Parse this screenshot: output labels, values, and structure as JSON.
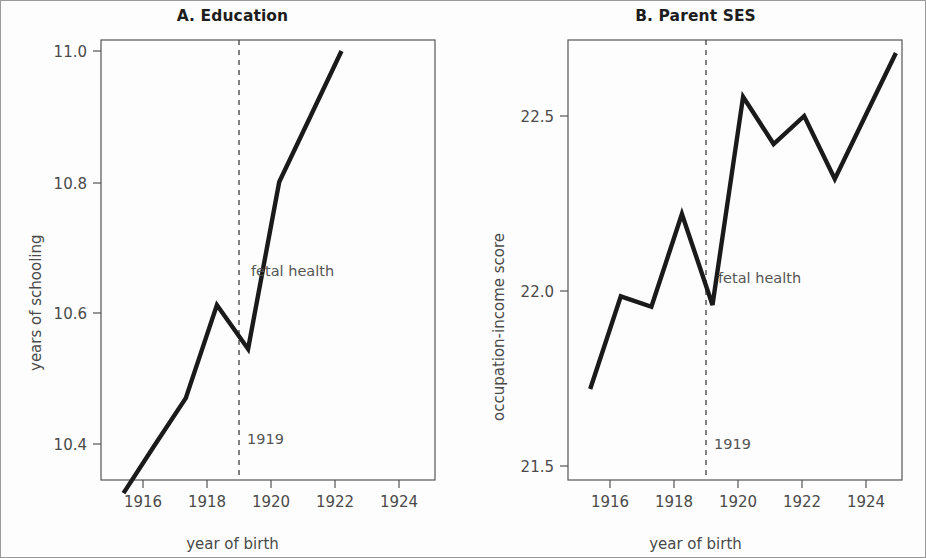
{
  "figure": {
    "background": "#ffffff",
    "line_color": "#1a1a1a",
    "axis_color": "#555555",
    "text_color": "#4a4a4a"
  },
  "panel_a": {
    "title": "A. Education",
    "xlabel": "year of birth",
    "ylabel": "years of schooling",
    "annotation_event": "fetal health",
    "annotation_year": "1919",
    "xticks": [
      "1916",
      "1918",
      "1920",
      "1922",
      "1924"
    ],
    "yticks": [
      "10.4",
      "10.6",
      "10.8",
      "11.0"
    ]
  },
  "panel_b": {
    "title": "B. Parent SES",
    "xlabel": "year of birth",
    "ylabel": "occupation-income score",
    "annotation_event": "fetal health",
    "annotation_year": "1919",
    "xticks": [
      "1916",
      "1918",
      "1920",
      "1922",
      "1924"
    ],
    "yticks": [
      "21.5",
      "22.0",
      "22.5"
    ]
  },
  "chart_data": [
    {
      "type": "line",
      "panel": "A",
      "title": "A. Education",
      "xlabel": "year of birth",
      "ylabel": "years of schooling",
      "x": [
        1915,
        1916,
        1917,
        1918,
        1919,
        1920,
        1921,
        1922
      ],
      "values": [
        10.325,
        10.398,
        10.47,
        10.612,
        10.545,
        10.8,
        10.9,
        11.0
      ],
      "xlim": [
        1914.6,
        1925.0
      ],
      "ylim": [
        10.3,
        11.02
      ],
      "xticks": [
        1916,
        1918,
        1920,
        1922,
        1924
      ],
      "yticks": [
        10.4,
        10.6,
        10.8,
        11.0
      ],
      "grid": false,
      "legend": "none",
      "annotations": [
        {
          "text": "fetal health",
          "x": 1919.2,
          "y": 10.665
        },
        {
          "text": "1919",
          "x": 1919.1,
          "y": 10.375
        }
      ],
      "vline": {
        "x": 1919,
        "style": "dashed",
        "label": "1919"
      }
    },
    {
      "type": "line",
      "panel": "B",
      "title": "B. Parent SES",
      "xlabel": "year of birth",
      "ylabel": "occupation-income score",
      "x": [
        1915,
        1916,
        1917,
        1918,
        1919,
        1920,
        1921,
        1922,
        1923,
        1924,
        1925
      ],
      "values": [
        21.72,
        21.985,
        21.955,
        22.22,
        21.96,
        22.555,
        22.42,
        22.5,
        22.32,
        22.5,
        22.68
      ],
      "xlim": [
        1914.6,
        1925.2
      ],
      "ylim": [
        21.45,
        22.72
      ],
      "xticks": [
        1916,
        1918,
        1920,
        1922,
        1924
      ],
      "yticks": [
        21.5,
        22.0,
        22.5
      ],
      "grid": false,
      "legend": "none",
      "annotations": [
        {
          "text": "fetal health",
          "x": 1919.2,
          "y": 22.06
        },
        {
          "text": "1919",
          "x": 1919.1,
          "y": 21.6
        }
      ],
      "vline": {
        "x": 1919,
        "style": "dashed",
        "label": "1919"
      }
    }
  ]
}
